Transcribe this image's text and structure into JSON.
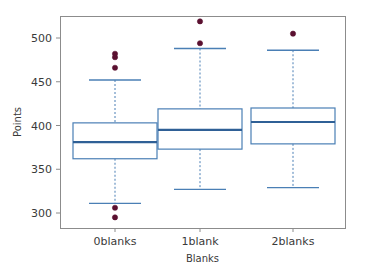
{
  "chart_data": {
    "type": "box",
    "title": "",
    "xlabel": "Blanks",
    "ylabel": "Points",
    "categories": [
      "0blanks",
      "1blank",
      "2blanks"
    ],
    "ylim": [
      288,
      526
    ],
    "yticks": [
      300,
      350,
      400,
      450,
      500
    ],
    "ytick_labels": [
      "300",
      "350",
      "400",
      "450",
      "500"
    ],
    "grid": false,
    "legend": null,
    "box_color": "#4a7fb5",
    "median_color": "#2f6096",
    "outlier_color": "#5a1030",
    "whisker_style": "dashed",
    "frame_color": "#8c8c8c",
    "boxes": [
      {
        "category": "0blanks",
        "whisker_low": 311,
        "q1": 362,
        "median": 381,
        "q3": 403,
        "whisker_high": 452,
        "outliers": [
          482,
          478,
          466,
          306,
          295
        ]
      },
      {
        "category": "1blank",
        "whisker_low": 327,
        "q1": 373,
        "median": 395,
        "q3": 419,
        "whisker_high": 488,
        "outliers": [
          519,
          494
        ]
      },
      {
        "category": "2blanks",
        "whisker_low": 329,
        "q1": 379,
        "median": 404,
        "q3": 420,
        "whisker_high": 486,
        "outliers": [
          505
        ]
      }
    ]
  }
}
